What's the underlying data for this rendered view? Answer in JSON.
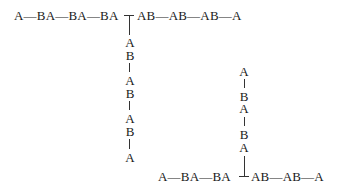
{
  "diagram": {
    "top_chain": {
      "left": "A—BA—BA—BA",
      "right": "AB—AB—AB—A"
    },
    "top_branch": [
      "A",
      "B",
      "|",
      "A",
      "B",
      "|",
      "A",
      "B",
      "|",
      "A"
    ],
    "bottom_branch": [
      "A",
      "|",
      "B",
      "A",
      "|",
      "B",
      "A"
    ],
    "bottom_chain": {
      "left": "A—BA—BA",
      "right": "AB—AB—A"
    }
  }
}
